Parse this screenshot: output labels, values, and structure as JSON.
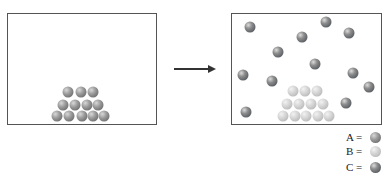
{
  "diagram": {
    "left_panel": {
      "description": "Solid crystal of A atoms stacked in a pyramid",
      "pyramid": {
        "type": "A",
        "rows": [
          [
            [
              68,
              92
            ],
            [
              81,
              92
            ],
            [
              93,
              92
            ]
          ],
          [
            [
              63,
              105
            ],
            [
              75,
              105
            ],
            [
              87,
              105
            ],
            [
              98,
              105
            ]
          ],
          [
            [
              57,
              116
            ],
            [
              69,
              116
            ],
            [
              82,
              116
            ],
            [
              93,
              116
            ],
            [
              104,
              116
            ]
          ]
        ]
      }
    },
    "arrow": {
      "direction": "right"
    },
    "right_panel": {
      "description": "B atoms remain in pyramid; C atoms dispersed as gas",
      "pyramid": {
        "type": "B",
        "rows": [
          [
            [
              293,
              91
            ],
            [
              305,
              91
            ],
            [
              317,
              91
            ]
          ],
          [
            [
              287,
              104
            ],
            [
              299,
              104
            ],
            [
              311,
              104
            ],
            [
              323,
              104
            ]
          ],
          [
            [
              283,
              116
            ],
            [
              295,
              116
            ],
            [
              306,
              116
            ],
            [
              318,
              116
            ],
            [
              329,
              116
            ]
          ]
        ]
      },
      "free_atoms": {
        "type": "C",
        "positions": [
          [
            250,
            27
          ],
          [
            326,
            22
          ],
          [
            349,
            33
          ],
          [
            302,
            37
          ],
          [
            278,
            52
          ],
          [
            315,
            64
          ],
          [
            353,
            73
          ],
          [
            243,
            75
          ],
          [
            272,
            81
          ],
          [
            369,
            87
          ],
          [
            346,
            103
          ],
          [
            246,
            112
          ]
        ]
      }
    },
    "legend": [
      {
        "label": "A =",
        "type": "A"
      },
      {
        "label": "B =",
        "type": "B"
      },
      {
        "label": "C =",
        "type": "C"
      }
    ],
    "colors": {
      "A": "#8a8a8a",
      "B": "#cfcfcf",
      "C": "#5e6368",
      "border": "#555555",
      "arrow": "#333333"
    }
  }
}
